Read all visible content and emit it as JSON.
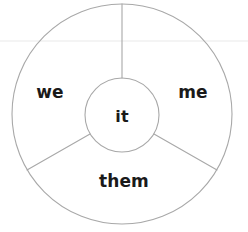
{
  "diagram": {
    "type": "radial-wheel",
    "background_color": "#ffffff",
    "stroke_color": "#a8a8a8",
    "text_color": "#1a1a1a",
    "center": {
      "x": 122,
      "y": 114
    },
    "outer_radius": 110,
    "inner_radius": 37,
    "hub": {
      "label": "it"
    },
    "sectors": [
      {
        "id": "we",
        "label": "we",
        "start_angle": 90,
        "end_angle": 210,
        "label_x": 50,
        "label_y": 92
      },
      {
        "id": "them",
        "label": "them",
        "start_angle": 210,
        "end_angle": 330,
        "label_x": 124,
        "label_y": 181
      },
      {
        "id": "me",
        "label": "me",
        "start_angle": 330,
        "end_angle": 90,
        "label_x": 193,
        "label_y": 92
      }
    ],
    "spokes": [
      {
        "id": "spoke-top",
        "angle": 90
      },
      {
        "id": "spoke-lower-left",
        "angle": 210
      },
      {
        "id": "spoke-lower-right",
        "angle": 330
      }
    ],
    "artifacts": {
      "scan_line_y": 41,
      "scan_line_color": "#f0f0f0"
    }
  }
}
